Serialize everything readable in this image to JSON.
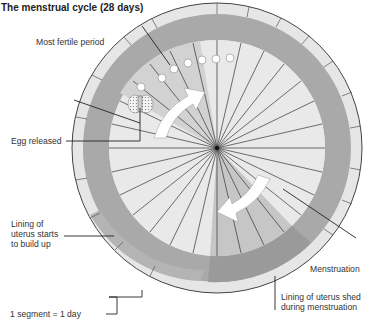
{
  "title": "The menstrual cycle (28 days)",
  "labels": {
    "most_fertile": "Most fertile period",
    "egg_released": "Egg released",
    "lining_builds_1": "Lining of",
    "lining_builds_2": "uterus starts",
    "lining_builds_3": "to build up",
    "menstruation": "Menstruation",
    "lining_shed_1": "Lining of uterus shed",
    "lining_shed_2": "during menstruation",
    "segment": "1 segment = 1 day"
  },
  "diagram": {
    "segments": 28,
    "center": [
      217,
      148
    ],
    "radius": 145,
    "colors": {
      "outer_ring": "#e6e6e6",
      "lining": "#a8a8a8",
      "inner_light": "#e9e9e9",
      "inner_mid": "#d8d8d8",
      "menstruation": "#bdbdbd",
      "arrow": "#ffffff",
      "lines": "#333333"
    }
  }
}
